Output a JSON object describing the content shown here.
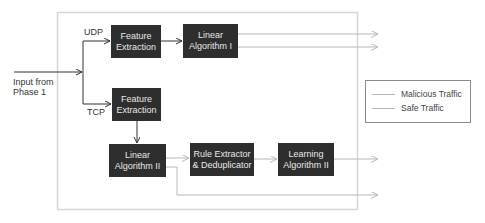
{
  "diagram": {
    "input_label": [
      "Input from",
      "Phase 1"
    ],
    "branches": {
      "udp": "UDP",
      "tcp": "TCP"
    },
    "nodes": {
      "feature_extraction_udp": [
        "Feature",
        "Extraction"
      ],
      "linear_algorithm_1": [
        "Linear",
        "Algorithm I"
      ],
      "feature_extraction_tcp": [
        "Feature",
        "Extraction"
      ],
      "linear_algorithm_2": [
        "Linear",
        "Algorithm II"
      ],
      "rule_extractor": [
        "Rule Extractor",
        "& Deduplicator"
      ],
      "learning_algorithm_2": [
        "Learning",
        "Algorithm II"
      ]
    },
    "legend": [
      {
        "label": "Malicious Traffic",
        "color": "#b5b5b5"
      },
      {
        "label": "Safe Traffic",
        "color": "#b5b5b5"
      }
    ],
    "colors": {
      "node_fill": "#2e2e2e",
      "node_text": "#e8e8e8",
      "primary_arrow": "#333333",
      "output_arrow": "#b8b8b8",
      "container_border": "#d6d6d6"
    }
  }
}
